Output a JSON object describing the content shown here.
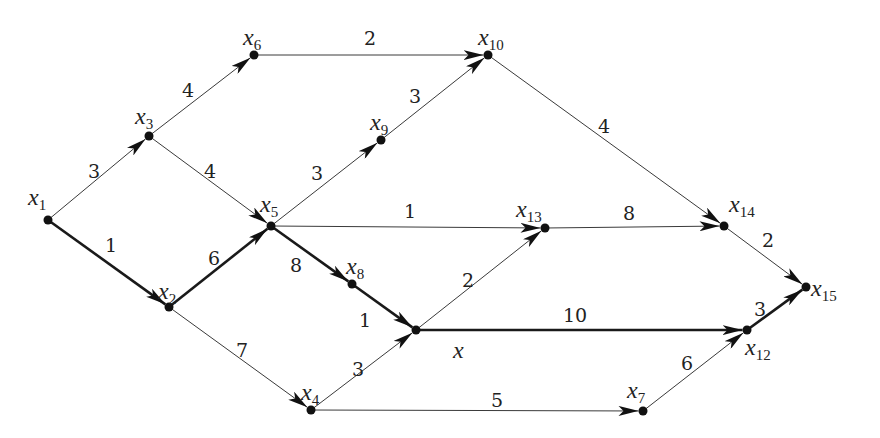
{
  "diagram": {
    "type": "directed-weighted-graph",
    "nodes": [
      {
        "id": "x1",
        "name": "x",
        "sub": "1",
        "x": 48,
        "y": 220,
        "lx": 28,
        "ly": 205
      },
      {
        "id": "x2",
        "name": "x",
        "sub": "2",
        "x": 169,
        "y": 307,
        "lx": 158,
        "ly": 299
      },
      {
        "id": "x3",
        "name": "x",
        "sub": "3",
        "x": 149,
        "y": 136,
        "lx": 135,
        "ly": 124
      },
      {
        "id": "x4",
        "name": "x",
        "sub": "4",
        "x": 311,
        "y": 410,
        "lx": 301,
        "ly": 400
      },
      {
        "id": "x5",
        "name": "x",
        "sub": "5",
        "x": 271,
        "y": 226,
        "lx": 260,
        "ly": 212
      },
      {
        "id": "x6",
        "name": "x",
        "sub": "6",
        "x": 254,
        "y": 55,
        "lx": 243,
        "ly": 45
      },
      {
        "id": "x7",
        "name": "x",
        "sub": "7",
        "x": 643,
        "y": 411,
        "lx": 627,
        "ly": 398
      },
      {
        "id": "x8",
        "name": "x",
        "sub": "8",
        "x": 352,
        "y": 284,
        "lx": 346,
        "ly": 274
      },
      {
        "id": "x9",
        "name": "x",
        "sub": "9",
        "x": 381,
        "y": 140,
        "lx": 370,
        "ly": 130
      },
      {
        "id": "x10",
        "name": "x",
        "sub": "10",
        "x": 488,
        "y": 55,
        "lx": 478,
        "ly": 45
      },
      {
        "id": "x",
        "name": "x",
        "sub": "",
        "x": 416,
        "y": 330,
        "lx": 453,
        "ly": 358
      },
      {
        "id": "x12",
        "name": "x",
        "sub": "12",
        "x": 747,
        "y": 330,
        "lx": 745,
        "ly": 355
      },
      {
        "id": "x13",
        "name": "x",
        "sub": "13",
        "x": 545,
        "y": 228,
        "lx": 516,
        "ly": 217
      },
      {
        "id": "x14",
        "name": "x",
        "sub": "14",
        "x": 724,
        "y": 226,
        "lx": 729,
        "ly": 212
      },
      {
        "id": "x15",
        "name": "x",
        "sub": "15",
        "x": 806,
        "y": 287,
        "lx": 811,
        "ly": 296
      }
    ],
    "edges": [
      {
        "from": "x1",
        "to": "x3",
        "weight": "3",
        "bold": false,
        "wx": 88,
        "wy": 178
      },
      {
        "from": "x1",
        "to": "x2",
        "weight": "1",
        "bold": true,
        "wx": 105,
        "wy": 252
      },
      {
        "from": "x3",
        "to": "x6",
        "weight": "4",
        "bold": false,
        "wx": 182,
        "wy": 97
      },
      {
        "from": "x3",
        "to": "x5",
        "weight": "4",
        "bold": false,
        "wx": 204,
        "wy": 178
      },
      {
        "from": "x2",
        "to": "x5",
        "weight": "6",
        "bold": true,
        "wx": 208,
        "wy": 265
      },
      {
        "from": "x2",
        "to": "x4",
        "weight": "7",
        "bold": false,
        "wx": 236,
        "wy": 357
      },
      {
        "from": "x6",
        "to": "x10",
        "weight": "2",
        "bold": false,
        "wx": 364,
        "wy": 45
      },
      {
        "from": "x5",
        "to": "x9",
        "weight": "3",
        "bold": false,
        "wx": 311,
        "wy": 180
      },
      {
        "from": "x9",
        "to": "x10",
        "weight": "3",
        "bold": false,
        "wx": 409,
        "wy": 103
      },
      {
        "from": "x5",
        "to": "x13",
        "weight": "1",
        "bold": false,
        "wx": 404,
        "wy": 218
      },
      {
        "from": "x5",
        "to": "x8",
        "weight": "8",
        "bold": true,
        "wx": 290,
        "wy": 272
      },
      {
        "from": "x8",
        "to": "x",
        "weight": "1",
        "bold": true,
        "wx": 359,
        "wy": 327
      },
      {
        "from": "x4",
        "to": "x",
        "weight": "3",
        "bold": false,
        "wx": 352,
        "wy": 376
      },
      {
        "from": "x",
        "to": "x13",
        "weight": "2",
        "bold": false,
        "wx": 462,
        "wy": 287
      },
      {
        "from": "x",
        "to": "x12",
        "weight": "10",
        "bold": true,
        "wx": 563,
        "wy": 322
      },
      {
        "from": "x4",
        "to": "x7",
        "weight": "5",
        "bold": false,
        "wx": 491,
        "wy": 407
      },
      {
        "from": "x10",
        "to": "x14",
        "weight": "4",
        "bold": false,
        "wx": 598,
        "wy": 133
      },
      {
        "from": "x13",
        "to": "x14",
        "weight": "8",
        "bold": false,
        "wx": 623,
        "wy": 220
      },
      {
        "from": "x14",
        "to": "x15",
        "weight": "2",
        "bold": false,
        "wx": 762,
        "wy": 247
      },
      {
        "from": "x12",
        "to": "x15",
        "weight": "3",
        "bold": true,
        "wx": 754,
        "wy": 316
      },
      {
        "from": "x7",
        "to": "x12",
        "weight": "6",
        "bold": false,
        "wx": 681,
        "wy": 370
      }
    ],
    "colors": {
      "line": "#3a3a3a",
      "bold_line": "#1a1a1a",
      "node": "#111111",
      "background": "#ffffff"
    }
  }
}
